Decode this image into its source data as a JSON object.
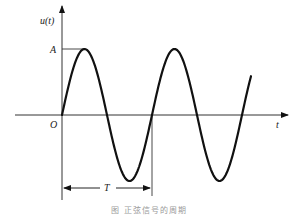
{
  "diagram": {
    "y_axis_label": "u(t)",
    "x_axis_label": "t",
    "origin_label": "O",
    "amplitude_label": "A",
    "period_label": "T",
    "caption": "图  正弦信号的周期"
  },
  "chart_data": {
    "type": "line",
    "xlabel": "t",
    "ylabel": "u(t)",
    "series": [
      {
        "name": "u(t)",
        "function": "A*sin(2*pi*t/T)",
        "t_range_in_periods": [
          0,
          2.1
        ]
      }
    ],
    "annotations": [
      {
        "label": "A",
        "meaning": "amplitude (peak value)"
      },
      {
        "label": "T",
        "meaning": "period, marked from t=0 to t=T with a double arrow"
      },
      {
        "label": "O",
        "meaning": "origin"
      }
    ],
    "grid": false
  },
  "colors": {
    "stroke": "#111111",
    "axis": "#333333",
    "caption": "#9a9a9a"
  }
}
